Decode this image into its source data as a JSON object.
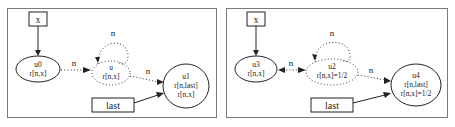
{
  "panels": [
    {
      "name": "left",
      "pointer_x": "x",
      "pointer_last": "last",
      "node_source": {
        "id": "u0",
        "pred": "r[n,x]"
      },
      "node_summary": {
        "id": "u",
        "pred": "r[n,x]"
      },
      "node_target": {
        "id": "u1",
        "pred1": "r[n,last]",
        "pred2": "r[n,x]"
      },
      "edge_labels": {
        "self_loop": "n",
        "source_to_summary": "n",
        "summary_to_target": "n"
      }
    },
    {
      "name": "right",
      "pointer_x": "x",
      "pointer_last": "last",
      "node_source": {
        "id": "u3",
        "pred": "r[n,x]"
      },
      "node_summary": {
        "id": "u2",
        "pred": "r[n,x]=1/2"
      },
      "node_target": {
        "id": "u4",
        "pred1": "r[n,last]",
        "pred2": "r[n,x]=1/2"
      },
      "edge_labels": {
        "self_loop": "n",
        "source_to_summary": "n",
        "summary_to_target": "n"
      }
    }
  ],
  "colors": {
    "frame": "#7a7a7a",
    "node_stroke": "#222222",
    "background": "#ffffff"
  }
}
